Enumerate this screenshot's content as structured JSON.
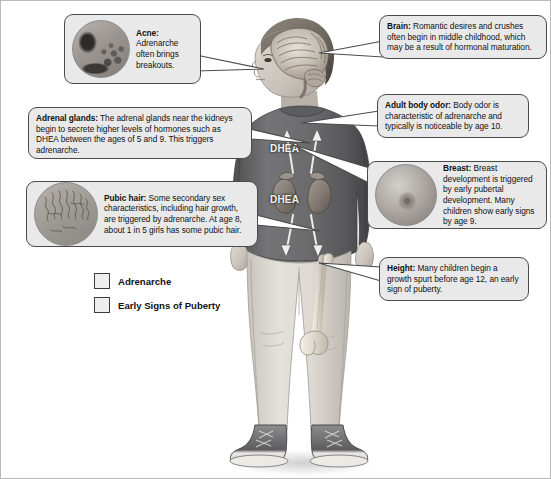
{
  "diagram": {
    "background_color": "#ffffff",
    "box_fill_color": "#e9e9e9",
    "box_border_color": "#4a4a4a"
  },
  "callouts": [
    {
      "id": "acne",
      "heading": "Acne:",
      "body": "Adrenarche often brings breakouts.",
      "thumbnail": "acne-skin-photo",
      "category": "Adrenarche"
    },
    {
      "id": "adrenal_glands",
      "heading": "Adrenal glands:",
      "body": "The adrenal glands near the kidneys begin to secrete higher levels of hormones such as DHEA between the ages of 5 and 9. This triggers adrenarche.",
      "category": "Adrenarche"
    },
    {
      "id": "pubic_hair",
      "heading": "Pubic hair:",
      "body": "Some secondary sex characteristics, including hair growth, are triggered by adrenarche. At age 8, about 1 in 5 girls has some pubic hair.",
      "thumbnail": "pubic-hair-photo",
      "category": "Adrenarche"
    },
    {
      "id": "brain",
      "heading": "Brain:",
      "body": "Romantic desires and crushes often begin in middle childhood, which may be a result of hormonal maturation.",
      "category": "Adrenarche"
    },
    {
      "id": "adult_body_odor",
      "heading": "Adult body odor:",
      "body": "Body odor is characteristic of adrenarche and typically is noticeable by age 10.",
      "category": "Adrenarche"
    },
    {
      "id": "breast",
      "heading": "Breast:",
      "body": "Breast development is triggered by early pubertal development. Many children show early signs by age 9.",
      "thumbnail": "breast-photo",
      "category": "Early Signs of Puberty"
    },
    {
      "id": "height",
      "heading": "Height:",
      "body": "Many children begin a growth spurt before age 12, an early sign of puberty.",
      "category": "Early Signs of Puberty"
    }
  ],
  "legend": {
    "items": [
      {
        "label": "Adrenarche",
        "swatch_color": "#eeeeee"
      },
      {
        "label": "Early Signs of Puberty",
        "swatch_color": "#eeeeee"
      }
    ]
  },
  "figure": {
    "hormone_label_top": "DHEA",
    "hormone_label_bottom": "DHEA",
    "anatomy_shown": [
      "brain-cutaway",
      "kidneys",
      "adrenal-glands",
      "femur-bone"
    ],
    "clothing": {
      "top": "dark-gray-sweatshirt",
      "bottom": "light-gray-pants",
      "shoes": "gray-high-top-sneakers"
    }
  }
}
